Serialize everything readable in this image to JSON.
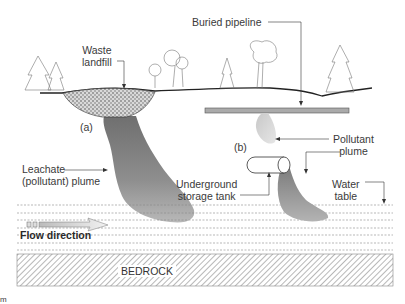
{
  "figure": {
    "labels": {
      "waste_landfill": [
        "Waste",
        "landfill"
      ],
      "buried_pipeline": "Buried pipeline",
      "marker_a": "(a)",
      "marker_b": "(b)",
      "leachate_plume": [
        "Leachate",
        "(pollutant) plume"
      ],
      "pollutant_plume": [
        "Pollutant",
        "plume"
      ],
      "underground_tank": [
        "Underground",
        "storage tank"
      ],
      "water_table": [
        "Water",
        "table"
      ],
      "flow_direction": "Flow direction",
      "bedrock": "BEDROCK",
      "corner_fragment": "m"
    },
    "colors": {
      "line": "#333333",
      "plume_dark": "#7a7a7a",
      "plume_light": "#bdbdbd",
      "pipeline": "#a9a9a9",
      "hatch": "#888888"
    }
  }
}
